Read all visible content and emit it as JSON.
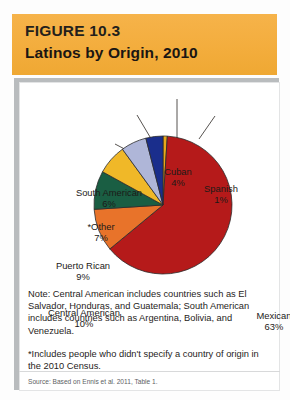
{
  "figure": {
    "number": "FIGURE 10.3",
    "title": "Latinos by Origin, 2010"
  },
  "notes": {
    "note": "Note: Central American includes countries such as El Salvador, Honduras, and Guatemala; South American includes countries such as Argentina, Bolivia, and Venezuela.",
    "footnote": "*Includes people who didn't specify a country of origin in the 2010 Census.",
    "source": "Source: Based on Ennis et al. 2011, Table 1."
  },
  "labels": {
    "mexican": "Mexican",
    "mexican_pct": "63%",
    "central_american": "Central American",
    "central_american_pct": "10%",
    "puerto_rican": "Puerto Rican",
    "puerto_rican_pct": "9%",
    "other": "*Other",
    "other_pct": "7%",
    "south_american": "South American",
    "south_american_pct": "6%",
    "cuban": "Cuban",
    "cuban_pct": "4%",
    "spanish": "Spanish",
    "spanish_pct": "1%"
  },
  "colors": {
    "banner": "#f3ad3d",
    "mexican": "#b51a1a",
    "central_american": "#e8732a",
    "puerto_rican": "#1a5e43",
    "other": "#f0b828",
    "south_american": "#afb6d8",
    "cuban": "#1a2e8c",
    "spanish": "#e8a91a",
    "slice_outline": "#2b2b2b",
    "panel_border": "#b9bcbe"
  },
  "chart_data": {
    "type": "pie",
    "title": "Latinos by Origin, 2010",
    "categories": [
      "Spanish",
      "Mexican",
      "Central American",
      "Puerto Rican",
      "*Other",
      "South American",
      "Cuban"
    ],
    "values": [
      1,
      63,
      10,
      9,
      7,
      6,
      4
    ],
    "unit": "percent",
    "labels": [
      "1%",
      "63%",
      "10%",
      "9%",
      "7%",
      "6%",
      "4%"
    ],
    "colors": [
      "#e8a91a",
      "#b51a1a",
      "#e8732a",
      "#1a5e43",
      "#f0b828",
      "#afb6d8",
      "#1a2e8c"
    ],
    "start_angle_deg": 0,
    "direction": "clockwise",
    "legend": "none",
    "grid": false,
    "annotations": [
      "leader lines from each slice to an external text label"
    ]
  }
}
